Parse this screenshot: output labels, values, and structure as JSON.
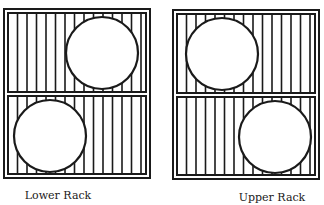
{
  "diagram": {
    "colors": {
      "ink": "#1a1a1a",
      "background": "#ffffff"
    },
    "racks": [
      {
        "id": "lower",
        "label": "Lower Rack",
        "label_pos": {
          "x": 58,
          "y": 189
        },
        "frame": {
          "x": 4,
          "y": 9,
          "w": 146,
          "h": 169
        },
        "panels": [
          {
            "x": 8,
            "y": 13,
            "w": 138,
            "h": 79
          },
          {
            "x": 8,
            "y": 96,
            "w": 138,
            "h": 78
          }
        ],
        "circles": [
          {
            "cx": 102,
            "cy": 53,
            "r": 36
          },
          {
            "cx": 50,
            "cy": 136,
            "r": 36
          }
        ]
      },
      {
        "id": "upper",
        "label": "Upper Rack",
        "label_pos": {
          "x": 272,
          "y": 191
        },
        "frame": {
          "x": 173,
          "y": 10,
          "w": 146,
          "h": 169
        },
        "panels": [
          {
            "x": 177,
            "y": 14,
            "w": 138,
            "h": 79
          },
          {
            "x": 177,
            "y": 97,
            "w": 138,
            "h": 78
          }
        ],
        "circles": [
          {
            "cx": 222,
            "cy": 54,
            "r": 36
          },
          {
            "cx": 275,
            "cy": 137,
            "r": 36
          }
        ]
      }
    ],
    "bar_spacing": 9.5
  }
}
